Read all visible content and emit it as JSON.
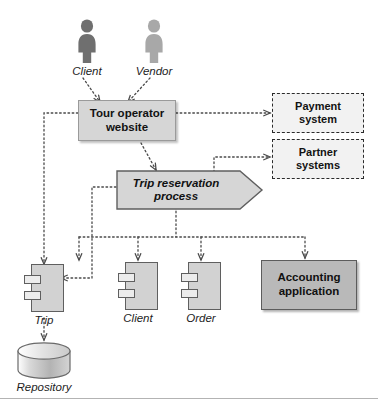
{
  "diagram": {
    "actors": [
      {
        "name": "client-actor",
        "label": "Client",
        "color": "#6f6f6f"
      },
      {
        "name": "vendor-actor",
        "label": "Vendor",
        "color": "#a8a8a8"
      }
    ],
    "website": {
      "label_line1": "Tour operator",
      "label_line2": "website",
      "fill": "#d6d6d6"
    },
    "external_systems": [
      {
        "name": "payment-system",
        "label_line1": "Payment",
        "label_line2": "system"
      },
      {
        "name": "partner-systems",
        "label_line1": "Partner",
        "label_line2": "systems"
      }
    ],
    "process": {
      "label_line1": "Trip reservation",
      "label_line2": "process",
      "fill": "#d6d6d6"
    },
    "components": [
      {
        "name": "trip-component",
        "label": "Trip"
      },
      {
        "name": "client-component",
        "label": "Client"
      },
      {
        "name": "order-component",
        "label": "Order"
      }
    ],
    "accounting": {
      "label_line1": "Accounting",
      "label_line2": "application",
      "fill": "#b9b9b9"
    },
    "repository": {
      "label": "Repository",
      "fill": "#c4c4c4"
    },
    "connector_style": {
      "stroke": "#555555",
      "dash": "dotted",
      "arrowhead": "open"
    }
  }
}
